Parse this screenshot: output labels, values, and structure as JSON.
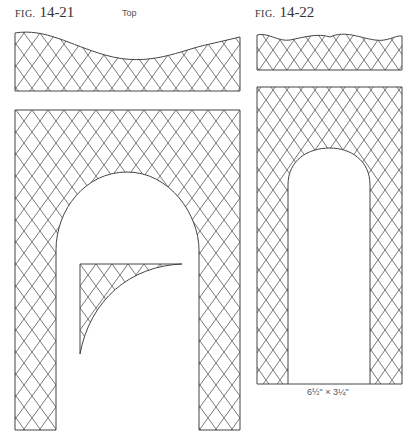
{
  "figures": [
    {
      "id": "14-21",
      "prefix": "FIG.",
      "number": "14-21",
      "top_label": "Top"
    },
    {
      "id": "14-22",
      "prefix": "FIG.",
      "number": "14-22",
      "dimension_label": "6½\" × 3¼\""
    }
  ],
  "style": {
    "line_color": "#444444",
    "hatch_color": "#555555",
    "background": "#ffffff"
  }
}
